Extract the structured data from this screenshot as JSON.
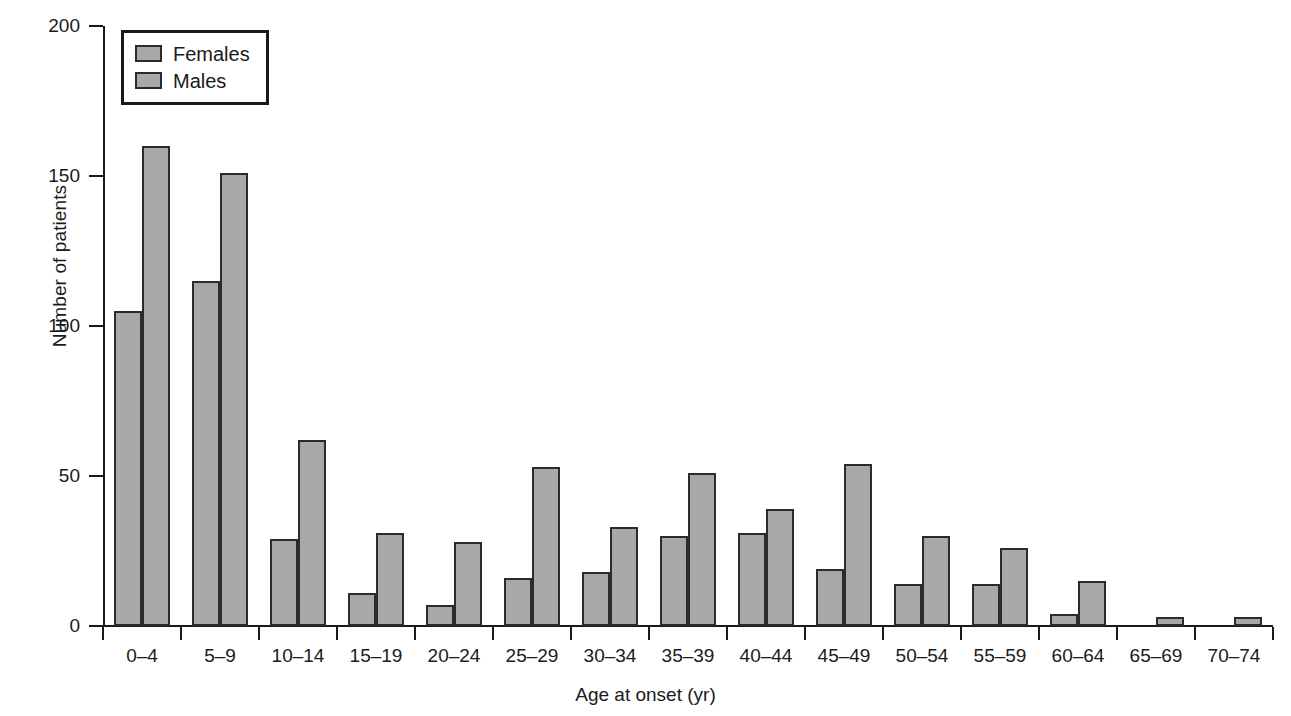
{
  "chart_data": {
    "type": "bar",
    "title": "",
    "xlabel": "Age at onset (yr)",
    "ylabel": "Number of patients",
    "categories": [
      "0–4",
      "5–9",
      "10–14",
      "15–19",
      "20–24",
      "25–29",
      "30–34",
      "35–39",
      "40–44",
      "45–49",
      "50–54",
      "55–59",
      "60–64",
      "65–69",
      "70–74"
    ],
    "series": [
      {
        "name": "Females",
        "color": "#a8a8a8",
        "values": [
          105,
          115,
          29,
          11,
          7,
          16,
          18,
          30,
          31,
          19,
          14,
          14,
          4,
          0,
          0
        ]
      },
      {
        "name": "Males",
        "color": "#a8a8a8",
        "values": [
          160,
          151,
          62,
          31,
          28,
          53,
          33,
          51,
          39,
          54,
          30,
          26,
          15,
          3,
          3
        ]
      }
    ],
    "ylim": [
      0,
      200
    ],
    "yticks": [
      0,
      50,
      100,
      150,
      200
    ],
    "ytick_labels": [
      "0",
      "50",
      "100",
      "150",
      "200"
    ],
    "grid": false,
    "legend_position": "top-left",
    "legend_entries": [
      "Females",
      "Males"
    ]
  }
}
